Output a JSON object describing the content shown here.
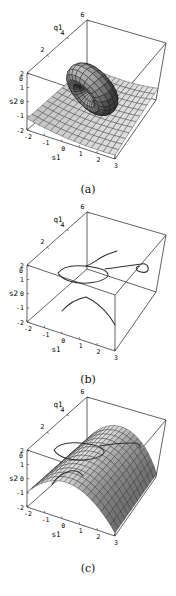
{
  "page": {
    "background": "#ffffff"
  },
  "chart_data": [
    {
      "id": "a",
      "type": "surface3d",
      "caption": "(a)",
      "axes": {
        "s1": {
          "label": "s1",
          "range": [
            -2,
            3
          ],
          "ticks": [
            -2,
            -1,
            0,
            1,
            2,
            3
          ]
        },
        "q1": {
          "label": "q1",
          "range": [
            0,
            6
          ],
          "ticks": [
            0,
            2,
            4,
            6
          ]
        },
        "s2": {
          "label": "s2",
          "range": [
            -2,
            2
          ],
          "ticks": [
            -2,
            -1,
            0,
            1,
            2
          ]
        }
      },
      "tick_colors": {},
      "surfaces": [
        {
          "name": "saddle-sheet",
          "kind": "sheet",
          "params": {
            "a": -1.2,
            "b": -0.28,
            "c": 0.035,
            "d": 0.018
          },
          "divisions": [
            15,
            12
          ],
          "base_gray": 120,
          "gain": 125
        },
        {
          "name": "torus-tube",
          "kind": "torus",
          "params": {
            "center": [
              0.4,
              2.6,
              0.15
            ],
            "axis": [
              -0.35,
              -1,
              -0.3
            ],
            "R": 1.05,
            "r": 0.65
          },
          "divisions": [
            24,
            13
          ],
          "base_gray": 62,
          "gain": 125
        }
      ],
      "overlay_curves": []
    },
    {
      "id": "b",
      "type": "curves3d",
      "caption": "(b)",
      "axes": {
        "s1": {
          "label": "s1",
          "range": [
            -2,
            3
          ],
          "ticks": [
            -2,
            -1,
            0,
            1,
            2,
            3
          ]
        },
        "q1": {
          "label": "q1",
          "range": [
            0,
            6
          ],
          "ticks": [
            0,
            2,
            4,
            6
          ]
        },
        "s2": {
          "label": "s2",
          "range": [
            -2,
            2
          ],
          "ticks": [
            -2,
            -1,
            0,
            1,
            2
          ]
        }
      },
      "tick_colors": {},
      "surfaces": [],
      "overlay_curves": [
        {
          "name": "upper-s-curve",
          "path": "M86,68 C92,66 97,62 102,59 C107,56 111,55 117,53"
        },
        {
          "name": "middle-loop",
          "path": "M58,75 C62,69 72,67 84,68 C96,69 106,71 108,76 C109,80 100,84 88,85 C74,86 62,82 58,75 Z"
        },
        {
          "name": "right-curve-with-end-loop",
          "path": "M105,71 C112,70 128,68 141,66 C146,65 149,68 148,72 C147,75 142,75 138,73 C135,71 136,69 139,68"
        },
        {
          "name": "lower-arc",
          "path": "M62,113 C68,106 76,101 86,99 C95,103 103,110 110,119 L115,127"
        }
      ]
    },
    {
      "id": "c",
      "type": "surface3d",
      "caption": "(c)",
      "axes": {
        "s1": {
          "label": "s1",
          "range": [
            -2,
            3
          ],
          "ticks": [
            -2,
            -1,
            0,
            1,
            2,
            3
          ]
        },
        "q1": {
          "label": "q1",
          "range": [
            0,
            6
          ],
          "ticks": [
            0,
            2,
            4,
            6
          ]
        },
        "s2": {
          "label": "s2",
          "range": [
            -2,
            2
          ],
          "ticks": [
            -2,
            -1,
            0,
            1,
            2
          ]
        }
      },
      "tick_colors": {
        "q1_2": "#2f7d32",
        "s2_2": "#4f4fa8"
      },
      "surfaces": [
        {
          "name": "dome",
          "kind": "dome",
          "params": {
            "peak": 0.65,
            "k": 0.32,
            "c": 0.25
          },
          "divisions": [
            19,
            13
          ],
          "base_gray": 112,
          "gain": 128
        }
      ],
      "overlay_curves": [
        {
          "name": "loop-on-surface",
          "path": "M54,67 C58,61 68,59 80,60 C92,61 102,63 104,68 C105,72 96,76 84,77 C70,78 58,74 54,67 Z"
        },
        {
          "name": "crest-curve",
          "path": "M100,63 C110,61 122,60 133,60 C138,60 141,62 140,65"
        },
        {
          "name": "front-arc",
          "path": "M52,101 C57,94 63,90 70,88 C76,87 80,89 83,93"
        }
      ]
    }
  ]
}
